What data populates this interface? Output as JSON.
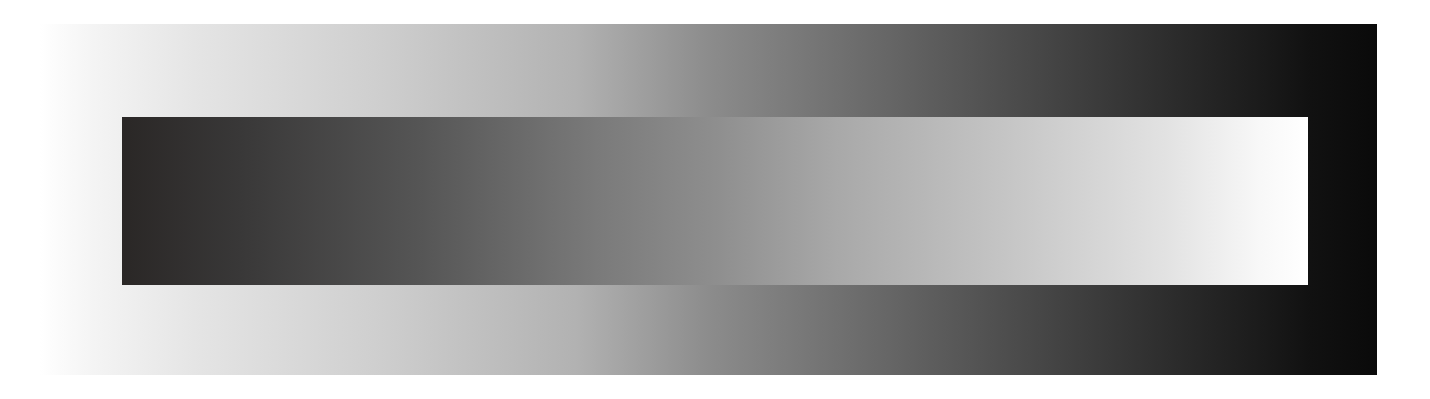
{
  "figure": {
    "background_gradient": {
      "direction": "left-to-right",
      "start_color": "#ffffff",
      "mid_color": "#8c8c8c",
      "end_color": "#0a0a0a"
    },
    "bar_gradient": {
      "direction": "left-to-right",
      "start_color": "#2a2726",
      "mid_color": "#8e8e8e",
      "end_color": "#ffffff"
    }
  }
}
